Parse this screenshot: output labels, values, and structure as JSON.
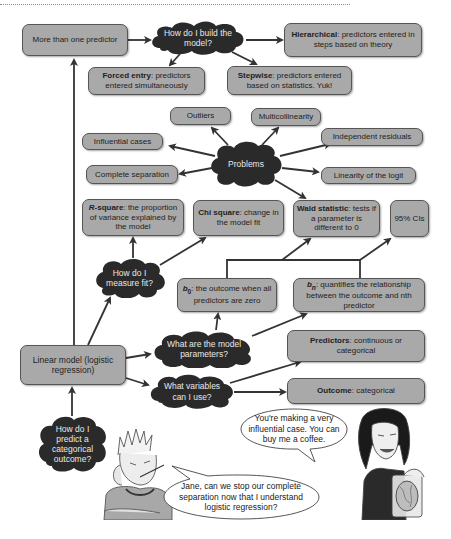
{
  "diagram": {
    "start": {
      "question": "How do I predict a categorical outcome?"
    },
    "linear_model": {
      "label": "Linear model (logistic regression)"
    },
    "more_than_one": {
      "label": "More than one predictor"
    },
    "build_model": {
      "question": "How do I build the model?",
      "hierarchical": {
        "bold": "Hierarchical",
        "text": ": predictors entered in steps based on theory"
      },
      "forced_entry": {
        "bold": "Forced entry",
        "text": ": predictors entered simultaneously"
      },
      "stepwise": {
        "bold": "Stepwise",
        "text": ": predictors entered based on statistics. Yuk!"
      }
    },
    "problems": {
      "label": "Problems",
      "items": [
        "Outliers",
        "Multicollinearity",
        "Influential cases",
        "Independent residuals",
        "Complete separation",
        "Linearity of the logit"
      ]
    },
    "measure_fit": {
      "question": "How do I measure fit?",
      "r_square": {
        "bold": "R",
        "bold2": "-square",
        "text": ": the proportion of variance explained by the model"
      },
      "chi_square": {
        "bold": "Chi square",
        "text": ": change in the model fit"
      }
    },
    "parameters": {
      "question": "What are the model parameters?",
      "wald": {
        "bold": "Wald statistic",
        "text": ": tests if a parameter is different to 0"
      },
      "ci": {
        "label": "95% CIs"
      },
      "b0": {
        "symbol": "b",
        "sub": "0",
        "text": ": the outcome when all predictors are zero"
      },
      "bn": {
        "symbol": "b",
        "sub": "n",
        "text": ": quantifies the relationship between the outcome and nth predictor"
      }
    },
    "variables": {
      "question": "What variables can I use?",
      "predictors": {
        "bold": "Predictors",
        "text": ": continuous or categorical"
      },
      "outcome": {
        "bold": "Outcome",
        "text": ": categorical"
      }
    }
  },
  "characters": {
    "jane_speech": "You're making a very influential case. You can buy me a coffee.",
    "student_speech": "Jane, can we stop our complete separation now that I understand logistic regression?"
  },
  "colors": {
    "box_fill": "#a9a9a9",
    "cloud_fill": "#2a2a2a",
    "arrow": "#333333"
  }
}
